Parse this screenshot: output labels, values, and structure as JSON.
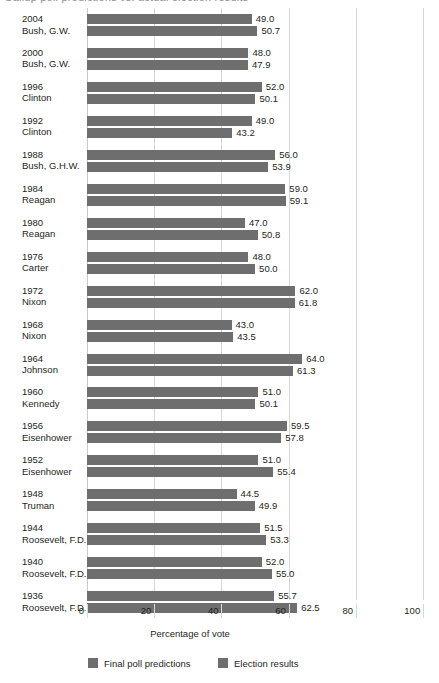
{
  "title_fragment": "Gallup poll predictions vs. actual election results",
  "chart_data": {
    "type": "bar",
    "orientation": "horizontal",
    "title": "",
    "xlabel": "Percentage of vote",
    "ylabel": "",
    "xlim": [
      0,
      100
    ],
    "xticks": [
      0,
      20,
      40,
      60,
      80,
      100
    ],
    "grid": true,
    "legend_position": "bottom",
    "bar_color": "#6e6e6e",
    "categories": [
      "2004\nBush, G.W.",
      "2000\nBush, G.W.",
      "1996\nClinton",
      "1992\nClinton",
      "1988\nBush, G.H.W.",
      "1984\nReagan",
      "1980\nReagan",
      "1976\nCarter",
      "1972\nNixon",
      "1968\nNixon",
      "1964\nJohnson",
      "1960\nKennedy",
      "1956\nEisenhower",
      "1952\nEisenhower",
      "1948\nTruman",
      "1944\nRoosevelt, F.D.",
      "1940\nRoosevelt, F.D.",
      "1936\nRoosevelt, F.D."
    ],
    "series": [
      {
        "name": "Final poll predictions",
        "values": [
          49.0,
          48.0,
          52.0,
          49.0,
          56.0,
          59.0,
          47.0,
          48.0,
          62.0,
          43.0,
          64.0,
          51.0,
          59.5,
          51.0,
          44.5,
          51.5,
          52.0,
          55.7
        ]
      },
      {
        "name": "Election results",
        "values": [
          50.7,
          47.9,
          50.1,
          43.2,
          53.9,
          59.1,
          50.8,
          50.0,
          61.8,
          43.5,
          61.3,
          50.1,
          57.8,
          55.4,
          49.9,
          53.3,
          55.0,
          62.5
        ]
      }
    ]
  },
  "rows": [
    {
      "year": "2004",
      "name": "Bush, G.W.",
      "poll": "49.0",
      "result": "50.7"
    },
    {
      "year": "2000",
      "name": "Bush, G.W.",
      "poll": "48.0",
      "result": "47.9"
    },
    {
      "year": "1996",
      "name": "Clinton",
      "poll": "52.0",
      "result": "50.1"
    },
    {
      "year": "1992",
      "name": "Clinton",
      "poll": "49.0",
      "result": "43.2"
    },
    {
      "year": "1988",
      "name": "Bush, G.H.W.",
      "poll": "56.0",
      "result": "53.9"
    },
    {
      "year": "1984",
      "name": "Reagan",
      "poll": "59.0",
      "result": "59.1"
    },
    {
      "year": "1980",
      "name": "Reagan",
      "poll": "47.0",
      "result": "50.8"
    },
    {
      "year": "1976",
      "name": "Carter",
      "poll": "48.0",
      "result": "50.0"
    },
    {
      "year": "1972",
      "name": "Nixon",
      "poll": "62.0",
      "result": "61.8"
    },
    {
      "year": "1968",
      "name": "Nixon",
      "poll": "43.0",
      "result": "43.5"
    },
    {
      "year": "1964",
      "name": "Johnson",
      "poll": "64.0",
      "result": "61.3"
    },
    {
      "year": "1960",
      "name": "Kennedy",
      "poll": "51.0",
      "result": "50.1"
    },
    {
      "year": "1956",
      "name": "Eisenhower",
      "poll": "59.5",
      "result": "57.8"
    },
    {
      "year": "1952",
      "name": "Eisenhower",
      "poll": "51.0",
      "result": "55.4"
    },
    {
      "year": "1948",
      "name": "Truman",
      "poll": "44.5",
      "result": "49.9"
    },
    {
      "year": "1944",
      "name": "Roosevelt, F.D.",
      "poll": "51.5",
      "result": "53.3"
    },
    {
      "year": "1940",
      "name": "Roosevelt, F.D.",
      "poll": "52.0",
      "result": "55.0"
    },
    {
      "year": "1936",
      "name": "Roosevelt, F.D.",
      "poll": "55.7",
      "result": "62.5"
    }
  ],
  "axis": {
    "ticks": [
      "0",
      "20",
      "40",
      "60",
      "80",
      "100"
    ],
    "xlabel": "Percentage of vote"
  },
  "legend": [
    {
      "label": "Final poll predictions",
      "color": "#6e6e6e"
    },
    {
      "label": "Election results",
      "color": "#6e6e6e"
    }
  ]
}
